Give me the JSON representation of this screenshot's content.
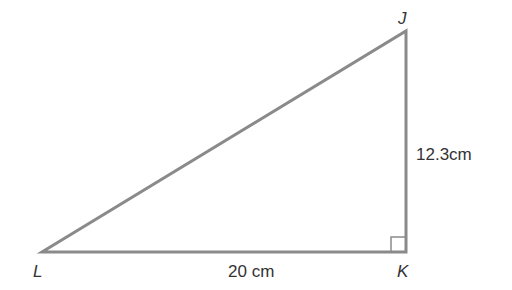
{
  "diagram": {
    "type": "right-triangle",
    "vertices": {
      "L": {
        "label": "L",
        "x": 42,
        "y": 252
      },
      "K": {
        "label": "K",
        "x": 406,
        "y": 252
      },
      "J": {
        "label": "J",
        "x": 406,
        "y": 31
      }
    },
    "right_angle_at": "K",
    "sides": {
      "LK": {
        "label": "20 cm"
      },
      "KJ": {
        "label": "12.3cm"
      }
    },
    "colors": {
      "stroke": "#8a8a8a",
      "text": "#333333"
    }
  }
}
